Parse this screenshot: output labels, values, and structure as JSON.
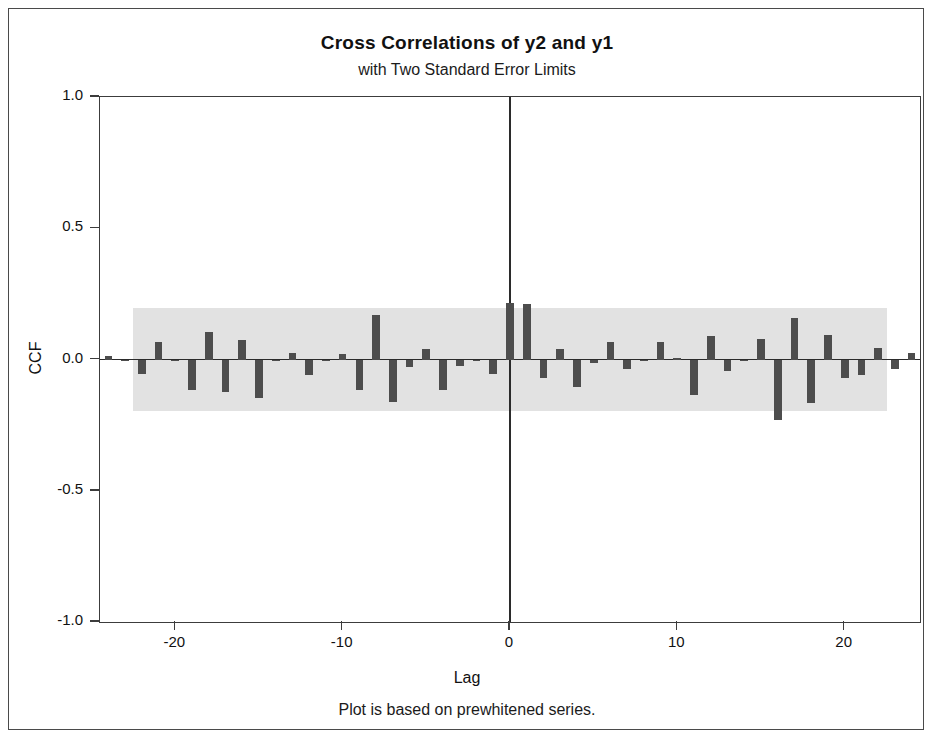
{
  "chart_data": {
    "type": "bar",
    "title": "Cross Correlations of y2 and y1",
    "subtitle": "with Two Standard Error Limits",
    "footnote": "Plot is based on prewhitened series.",
    "xlabel": "Lag",
    "ylabel": "CCF",
    "xlim": [
      -24.5,
      24.5
    ],
    "ylim": [
      -1.0,
      1.0
    ],
    "grid": false,
    "legend": null,
    "yticks": [
      "1.0",
      "0.5",
      "0.0",
      "-0.5",
      "-1.0"
    ],
    "ytick_values": [
      1.0,
      0.5,
      0.0,
      -0.5,
      -1.0
    ],
    "xticks": [
      "-20",
      "-10",
      "0",
      "10",
      "20"
    ],
    "xtick_values": [
      -20,
      -10,
      0,
      10,
      20
    ],
    "confidence_band": {
      "label": "Two Standard Error Limits",
      "upper": 0.195,
      "lower": -0.195,
      "x_start": -22.5,
      "x_end": 22.5,
      "color": "#e2e2e2"
    },
    "bar_color": "#4d4d4d",
    "categories": [
      -24,
      -23,
      -22,
      -21,
      -20,
      -19,
      -18,
      -17,
      -16,
      -15,
      -14,
      -13,
      -12,
      -11,
      -10,
      -9,
      -8,
      -7,
      -6,
      -5,
      -4,
      -3,
      -2,
      -1,
      0,
      1,
      2,
      3,
      4,
      5,
      6,
      7,
      8,
      9,
      10,
      11,
      12,
      13,
      14,
      15,
      16,
      17,
      18,
      19,
      20,
      21,
      22,
      23,
      24
    ],
    "values": [
      0.015,
      -0.005,
      -0.055,
      0.065,
      -0.005,
      -0.115,
      0.105,
      -0.125,
      0.075,
      -0.145,
      -0.005,
      0.025,
      -0.06,
      -0.005,
      0.02,
      -0.115,
      0.17,
      -0.16,
      -0.03,
      0.04,
      -0.115,
      -0.025,
      -0.005,
      -0.055,
      0.215,
      0.21,
      -0.07,
      0.04,
      -0.105,
      -0.015,
      0.065,
      -0.035,
      -0.005,
      0.065,
      0.005,
      -0.135,
      0.09,
      -0.045,
      -0.005,
      0.08,
      -0.23,
      0.16,
      -0.165,
      0.095,
      -0.07,
      -0.06,
      0.045,
      -0.035,
      0.025
    ]
  }
}
